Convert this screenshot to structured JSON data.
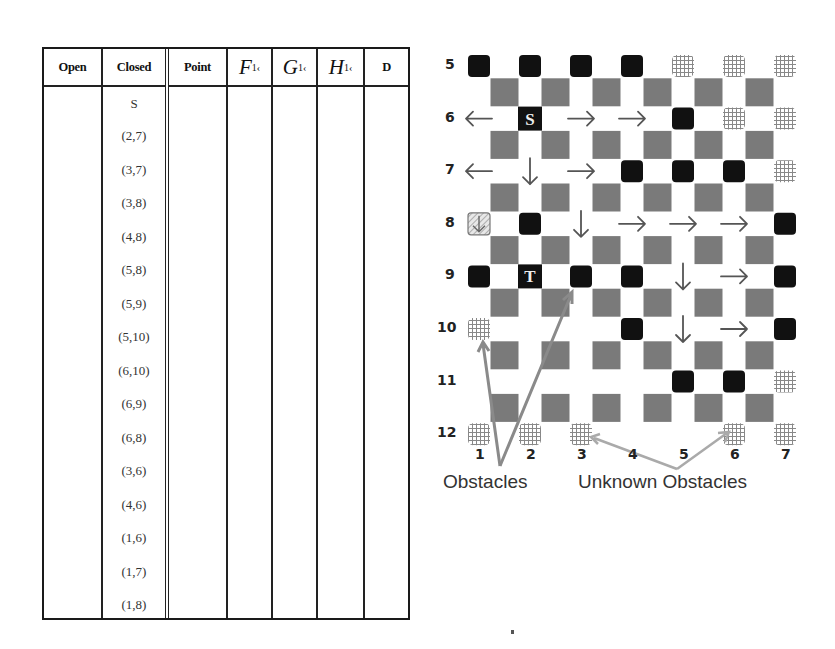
{
  "table": {
    "columns": [
      {
        "key": "open",
        "label": "Open",
        "type": "small"
      },
      {
        "key": "closed",
        "label": "Closed",
        "type": "small"
      },
      {
        "key": "point",
        "label": "Point",
        "type": "small"
      },
      {
        "key": "f",
        "label": "F",
        "sub": "1‹",
        "type": "math"
      },
      {
        "key": "g",
        "label": "G",
        "sub": "1‹",
        "type": "math"
      },
      {
        "key": "h",
        "label": "H",
        "sub": "1‹",
        "type": "math"
      },
      {
        "key": "d",
        "label": "D",
        "type": "small"
      }
    ],
    "closed_list": [
      "S",
      "(2,7)",
      "(3,7)",
      "(3,8)",
      "(4,8)",
      "(5,8)",
      "(5,9)",
      "(5,10)",
      "(6,10)",
      "(6,9)",
      "(6,8)",
      "(3,6)",
      "(4,6)",
      "(1,6)",
      "(1,7)",
      "(1,8)"
    ],
    "open_list": [],
    "point_list": [],
    "f_list": [],
    "g_list": [],
    "h_list": [],
    "d_list": []
  },
  "grid": {
    "row_labels": [
      "5",
      "6",
      "7",
      "8",
      "9",
      "10",
      "11",
      "12"
    ],
    "col_labels": [
      "1",
      "2",
      "3",
      "4",
      "5",
      "6",
      "7"
    ],
    "start_label": "S",
    "target_label": "T",
    "start_node": [
      2,
      6
    ],
    "target_node": [
      2,
      9
    ],
    "obstacles": [
      [
        1,
        5
      ],
      [
        2,
        5
      ],
      [
        3,
        5
      ],
      [
        4,
        5
      ],
      [
        5,
        6
      ],
      [
        4,
        7
      ],
      [
        5,
        7
      ],
      [
        6,
        7
      ],
      [
        2,
        8
      ],
      [
        7,
        8
      ],
      [
        1,
        9
      ],
      [
        3,
        9
      ],
      [
        4,
        9
      ],
      [
        7,
        9
      ],
      [
        4,
        10
      ],
      [
        7,
        10
      ],
      [
        5,
        11
      ],
      [
        6,
        11
      ]
    ],
    "unknown_obstacles": [
      [
        5,
        5
      ],
      [
        6,
        5
      ],
      [
        7,
        5
      ],
      [
        6,
        6
      ],
      [
        7,
        6
      ],
      [
        7,
        7
      ],
      [
        1,
        10
      ],
      [
        7,
        11
      ],
      [
        1,
        12
      ],
      [
        2,
        12
      ],
      [
        3,
        12
      ],
      [
        6,
        12
      ],
      [
        7,
        12
      ]
    ],
    "special_node": [
      1,
      8
    ],
    "arrows": [
      {
        "at": [
          1,
          6
        ],
        "dir": "left"
      },
      {
        "at": [
          3,
          6
        ],
        "dir": "right"
      },
      {
        "at": [
          4,
          6
        ],
        "dir": "right"
      },
      {
        "at": [
          1,
          7
        ],
        "dir": "left"
      },
      {
        "at": [
          2,
          7
        ],
        "dir": "down"
      },
      {
        "at": [
          3,
          7
        ],
        "dir": "right"
      },
      {
        "at": [
          3,
          8
        ],
        "dir": "down"
      },
      {
        "at": [
          4,
          8
        ],
        "dir": "right"
      },
      {
        "at": [
          5,
          8
        ],
        "dir": "right"
      },
      {
        "at": [
          6,
          8
        ],
        "dir": "right"
      },
      {
        "at": [
          5,
          9
        ],
        "dir": "down"
      },
      {
        "at": [
          6,
          9
        ],
        "dir": "right"
      },
      {
        "at": [
          5,
          10
        ],
        "dir": "down"
      },
      {
        "at": [
          6,
          10
        ],
        "dir": "right"
      }
    ],
    "captions": {
      "obstacles": "Obstacles",
      "unknown_obstacles": "Unknown Obstacles"
    },
    "colors": {
      "obstacle": "#111111",
      "gray_square": "#7a7a7a",
      "arrow": "#555555",
      "pointer_line": "#8a8a8a",
      "unknown_pointer_line": "#aaaaaa"
    }
  }
}
